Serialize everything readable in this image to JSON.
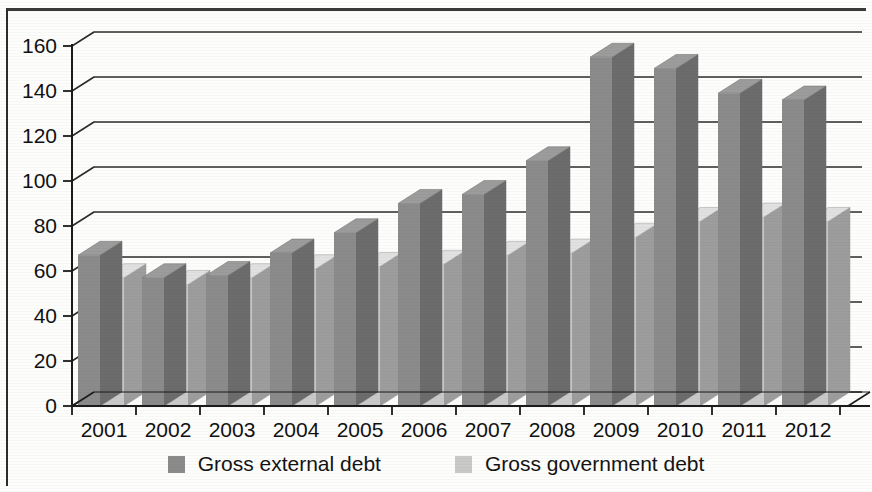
{
  "chart_data": {
    "type": "bar",
    "title": "",
    "subtitle": "",
    "xlabel": "",
    "ylabel": "",
    "categories": [
      "2001",
      "2002",
      "2003",
      "2004",
      "2005",
      "2006",
      "2007",
      "2008",
      "2009",
      "2010",
      "2011",
      "2012"
    ],
    "series": [
      {
        "name": "Gross external debt",
        "color": "#8b8b8b",
        "values": [
          67,
          57,
          58,
          68,
          77,
          90,
          94,
          109,
          155,
          150,
          139,
          136
        ]
      },
      {
        "name": "Gross government debt",
        "color": "#c9c9c9",
        "values": [
          57,
          54,
          57,
          61,
          62,
          63,
          67,
          68,
          75,
          82,
          84,
          82
        ]
      }
    ],
    "ylim": [
      0,
      160
    ],
    "yticks": [
      0,
      20,
      40,
      60,
      80,
      100,
      120,
      140,
      160
    ],
    "ytick_labels": [
      "0",
      "20",
      "40",
      "60",
      "80",
      "100",
      "120",
      "140",
      "160"
    ],
    "grid": true,
    "grid_axis": "y",
    "legend_position": "bottom",
    "style": "3d-bar-grayscale"
  },
  "legend": {
    "items": [
      {
        "label": "Gross external debt",
        "color": "#8b8b8b",
        "swatch": "legend-swatch-dark"
      },
      {
        "label": "Gross government debt",
        "color": "#c9c9c9",
        "swatch": "legend-swatch-light"
      }
    ]
  },
  "axes": {
    "y_tick_labels": [
      "160",
      "140",
      "120",
      "100",
      "80",
      "60",
      "40",
      "20",
      "0"
    ],
    "x_tick_labels": [
      "2001",
      "2002",
      "2003",
      "2004",
      "2005",
      "2006",
      "2007",
      "2008",
      "2009",
      "2010",
      "2011",
      "2012"
    ]
  },
  "colors": {
    "series_dark": "#8b8b8b",
    "series_light": "#c9c9c9",
    "axis": "#1b1b1b",
    "grid": "#2b2b2b",
    "background": "#fdfdfb"
  }
}
